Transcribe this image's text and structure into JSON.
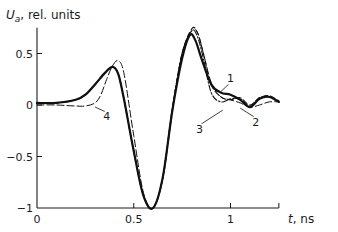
{
  "chart_data": {
    "type": "line",
    "title": "",
    "xlabel": "t, ns",
    "ylabel": "U_a, rel. units",
    "ylabel_main": "U",
    "ylabel_sub": "a",
    "ylabel_rest": ",  rel. units",
    "xlabel_var": "t",
    "xlabel_unit": ",  ns",
    "xlim": [
      0,
      1.25
    ],
    "ylim": [
      -1,
      0.75
    ],
    "grid": false,
    "legend": "inline numeric labels 1-4 with leader lines",
    "x_ticks": [
      {
        "value": 0,
        "label": "0"
      },
      {
        "value": 0.5,
        "label": "0.5"
      },
      {
        "value": 1,
        "label": "1"
      }
    ],
    "y_ticks": [
      {
        "value": 0.5,
        "label": "0.5"
      },
      {
        "value": 0,
        "label": "0"
      },
      {
        "value": -0.5,
        "label": "−0.5"
      },
      {
        "value": -1,
        "label": "−1"
      }
    ],
    "series": [
      {
        "name": "1",
        "style": "solid-thick",
        "x": [
          0,
          0.1,
          0.2,
          0.25,
          0.3,
          0.35,
          0.39,
          0.42,
          0.45,
          0.5,
          0.55,
          0.6,
          0.65,
          0.7,
          0.75,
          0.79,
          0.82,
          0.85,
          0.9,
          0.95,
          1.0,
          1.05,
          1.1,
          1.15,
          1.2,
          1.25
        ],
        "y": [
          0.02,
          0.02,
          0.05,
          0.1,
          0.2,
          0.31,
          0.37,
          0.3,
          0.05,
          -0.45,
          -0.88,
          -1.0,
          -0.7,
          -0.05,
          0.45,
          0.68,
          0.62,
          0.45,
          0.2,
          0.12,
          0.1,
          0.05,
          -0.02,
          0.06,
          0.08,
          0.03
        ]
      },
      {
        "name": "2",
        "style": "dashed",
        "x": [
          0,
          0.1,
          0.2,
          0.25,
          0.3,
          0.35,
          0.39,
          0.42,
          0.45,
          0.5,
          0.55,
          0.6,
          0.65,
          0.7,
          0.75,
          0.8,
          0.83,
          0.86,
          0.9,
          0.95,
          1.0,
          1.05,
          1.1,
          1.15,
          1.2,
          1.25
        ],
        "y": [
          0.02,
          0.02,
          0.05,
          0.1,
          0.2,
          0.31,
          0.37,
          0.3,
          0.05,
          -0.45,
          -0.88,
          -1.0,
          -0.7,
          -0.03,
          0.5,
          0.74,
          0.7,
          0.5,
          0.2,
          0.08,
          0.05,
          0.07,
          0.0,
          0.07,
          0.09,
          0.04
        ]
      },
      {
        "name": "3",
        "style": "dash-dot",
        "x": [
          0,
          0.1,
          0.2,
          0.25,
          0.3,
          0.35,
          0.39,
          0.42,
          0.45,
          0.5,
          0.55,
          0.6,
          0.65,
          0.7,
          0.75,
          0.8,
          0.83,
          0.86,
          0.9,
          0.95,
          1.0,
          1.05,
          1.1,
          1.15,
          1.2,
          1.25
        ],
        "y": [
          0.02,
          0.02,
          0.05,
          0.1,
          0.2,
          0.31,
          0.37,
          0.3,
          0.05,
          -0.45,
          -0.88,
          -1.0,
          -0.7,
          -0.03,
          0.5,
          0.72,
          0.66,
          0.45,
          0.12,
          0.03,
          0.06,
          0.06,
          -0.01,
          0.07,
          0.08,
          0.03
        ]
      },
      {
        "name": "4",
        "style": "dashed-long",
        "x": [
          0,
          0.1,
          0.2,
          0.25,
          0.3,
          0.33,
          0.36,
          0.39,
          0.42,
          0.45,
          0.5,
          0.55,
          0.6,
          0.65,
          0.7,
          0.75,
          0.8,
          0.83,
          0.86,
          0.9,
          0.95,
          1.0,
          1.05,
          1.1,
          1.15,
          1.2,
          1.25
        ],
        "y": [
          0.0,
          0.0,
          -0.01,
          -0.01,
          0.02,
          0.1,
          0.25,
          0.38,
          0.43,
          0.3,
          -0.3,
          -0.85,
          -1.0,
          -0.72,
          -0.06,
          0.5,
          0.72,
          0.7,
          0.5,
          0.22,
          0.08,
          0.05,
          0.02,
          -0.02,
          0.0,
          0.03,
          0.03
        ]
      }
    ],
    "annotations": [
      {
        "label": "1",
        "text_x": 1.0,
        "text_y": 0.22,
        "leader_to": [
          0.95,
          0.13
        ]
      },
      {
        "label": "2",
        "text_x": 1.13,
        "text_y": -0.2,
        "leader_to": [
          1.05,
          -0.03
        ]
      },
      {
        "label": "3",
        "text_x": 0.84,
        "text_y": -0.27,
        "leader_to": [
          0.96,
          -0.05
        ]
      },
      {
        "label": "4",
        "text_x": 0.36,
        "text_y": -0.15,
        "leader_to": [
          0.3,
          -0.02
        ]
      }
    ]
  }
}
